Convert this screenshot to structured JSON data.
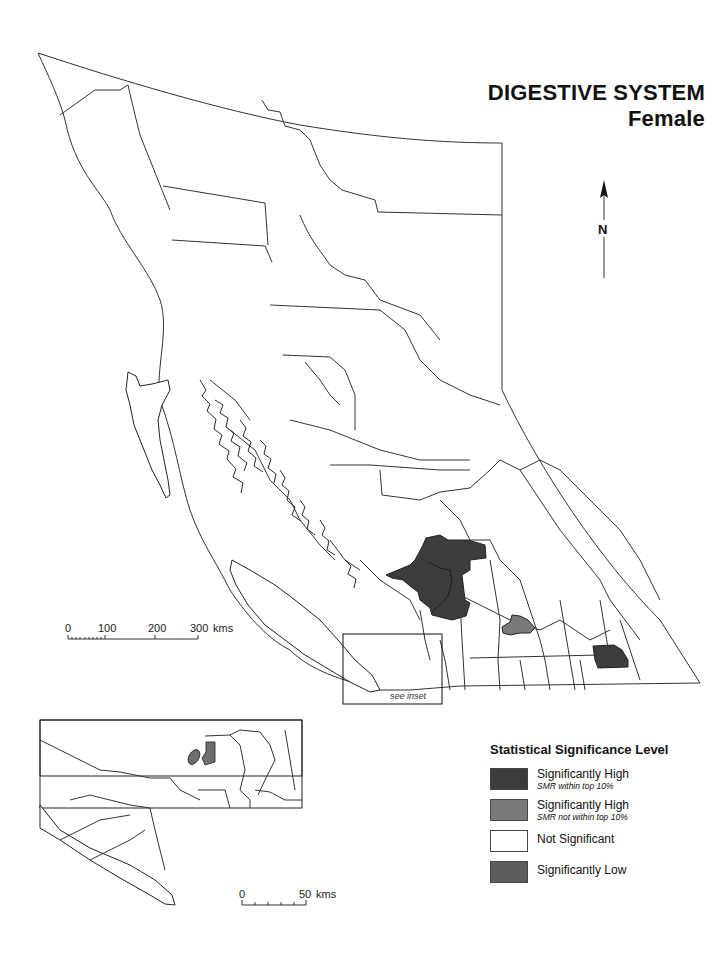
{
  "title": {
    "main": "DIGESTIVE SYSTEM",
    "sub": "Female"
  },
  "north_arrow": {
    "label": "N",
    "icon": "north-arrow-icon"
  },
  "main_scale": {
    "ticks": [
      "0",
      "100",
      "200",
      "300"
    ],
    "unit": "kms"
  },
  "inset_scale": {
    "ticks": [
      "0",
      "50"
    ],
    "unit": "kms"
  },
  "inset_label": "see inset",
  "legend": {
    "title": "Statistical Significance Level",
    "items": [
      {
        "label": "Significantly High",
        "note": "SMR within top 10%",
        "color": "#3c3c3c"
      },
      {
        "label": "Significantly High",
        "note": "SMR not within top 10%",
        "color": "#7a7a7a"
      },
      {
        "label": "Not Significant",
        "note": "",
        "color": "#ffffff"
      },
      {
        "label": "Significantly Low",
        "note": "",
        "color": "#5c5c5c"
      }
    ]
  },
  "map": {
    "shaded_regions": [
      {
        "name": "central-interior-high-top10",
        "level": "Significantly High (top 10%)",
        "color": "#3c3c3c"
      },
      {
        "name": "south-central-high",
        "level": "Significantly High (not top 10%)",
        "color": "#7a7a7a"
      },
      {
        "name": "southeast-high-top10",
        "level": "Significantly High (top 10%)",
        "color": "#3c3c3c"
      },
      {
        "name": "inset-high",
        "level": "Significantly High (not top 10%)",
        "color": "#6e6e6e"
      }
    ]
  }
}
